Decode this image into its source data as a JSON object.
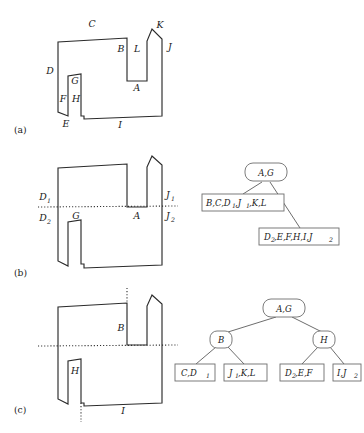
{
  "figure": {
    "panels": [
      {
        "tag": "(a)",
        "description": "Simple polygon with two notches; all boundary edges labeled A through L",
        "edge_labels": [
          "A",
          "B",
          "C",
          "D",
          "E",
          "F",
          "G",
          "H",
          "I",
          "J",
          "K",
          "L"
        ]
      },
      {
        "tag": "(b)",
        "description": "Polygon after a single horizontal cut through A and G; two-level tree",
        "edge_labels": [
          "D1",
          "D2",
          "G",
          "A",
          "J1",
          "J2"
        ],
        "tree": {
          "root": "A,G",
          "children": [
            "B,C,D1,J1,K,L",
            "D2,E,F,H,I,J2"
          ]
        }
      },
      {
        "tag": "(c)",
        "description": "Polygon after further vertical cuts at B and H; three-level tree",
        "edge_labels": [
          "B",
          "H",
          "I"
        ],
        "tree": {
          "root": "A,G",
          "internal": [
            "B",
            "H"
          ],
          "leaves": [
            "C,D1",
            "J1,K,L",
            "D2,E,F",
            "I,J2"
          ]
        }
      }
    ],
    "labels": {
      "a_A": "A",
      "a_B": "B",
      "a_C": "C",
      "a_D": "D",
      "a_E": "E",
      "a_F": "F",
      "a_G": "G",
      "a_H": "H",
      "a_I": "I",
      "a_J": "J",
      "a_K": "K",
      "a_L": "L",
      "b_D": "D",
      "b_D_sub1": "1",
      "b_D2": "D",
      "b_D_sub2": "2",
      "b_G": "G",
      "b_A": "A",
      "b_J": "J",
      "b_J_sub1": "1",
      "b_J2": "J",
      "b_J_sub2": "2",
      "c_B": "B",
      "c_H": "H",
      "c_I": "I",
      "tag_a": "(a)",
      "tag_b": "(b)",
      "tag_c": "(c)"
    },
    "tree_b": {
      "root": "A,G",
      "left_main": "B,C,D",
      "left_sub1": "1",
      "left_mid": ",J",
      "left_sub2": "1",
      "left_tail": ",K,L",
      "right_main": "D",
      "right_sub1": "2",
      "right_mid": ",E,F,H,I,J",
      "right_sub2": "2"
    },
    "tree_c": {
      "root": "A,G",
      "node_left": "B",
      "node_right": "H",
      "leaf1_main": "C,D",
      "leaf1_sub": "1",
      "leaf2_main": "J",
      "leaf2_sub": "1",
      "leaf2_tail": ",K,L",
      "leaf3_main": "D",
      "leaf3_sub": "2",
      "leaf3_tail": ",E,F",
      "leaf4_main": "I,J",
      "leaf4_sub": "2"
    },
    "colors": {
      "stroke": "#2b2b2b",
      "tree_stroke": "#6d6d6d",
      "background": "#ffffff"
    }
  }
}
